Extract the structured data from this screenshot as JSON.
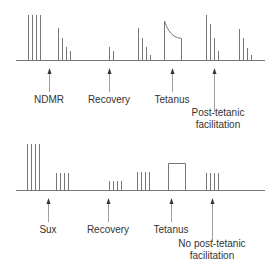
{
  "panels": [
    {
      "name": "ndmr-panel",
      "labels": {
        "ndmr": "NDMR",
        "recovery": "Recovery",
        "tetanus": "Tetanus",
        "post_tetanic_line1": "Post-tetanic",
        "post_tetanic_line2": "facilitation"
      }
    },
    {
      "name": "sux-panel",
      "labels": {
        "sux": "Sux",
        "recovery": "Recovery",
        "tetanus": "Tetanus",
        "no_post_tetanic_line1": "No post-tetanic",
        "no_post_tetanic_line2": "facilitation"
      }
    }
  ],
  "colors": {
    "trace": "#777777",
    "text": "#333333"
  }
}
